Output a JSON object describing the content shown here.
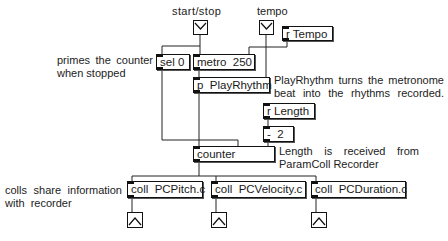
{
  "inputs": {
    "start_stop_label": "start/stop",
    "tempo_label": "tempo"
  },
  "objects": {
    "r_tempo": "r Tempo",
    "sel": "sel 0",
    "metro": "metro  250",
    "playrhythm": "p  PlayRhythm",
    "r_length": "r Length",
    "minus": "-  2",
    "counter": "counter",
    "coll_pitch": "coll  PCPitch.c",
    "coll_velocity": "coll  PCVelocity.c",
    "coll_duration": "coll  PCDuration.c"
  },
  "comments": {
    "primes_line1": "primes the counter",
    "primes_line2": "when stopped",
    "playrhythm_line1": "PlayRhythm turns the metronome",
    "playrhythm_line2": "beat into the rhythms recorded.",
    "length_line1": "Length is received from",
    "length_line2": "ParamColl Recorder",
    "colls_line1": "colls share information",
    "colls_line2": "with  recorder"
  },
  "icons": {
    "input_button": "envelope-down-icon",
    "output_button": "caret-up-icon"
  },
  "colors": {
    "line": "#111111",
    "background": "#ffffff"
  }
}
